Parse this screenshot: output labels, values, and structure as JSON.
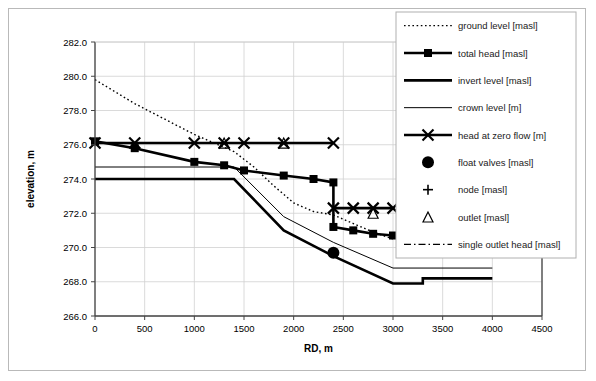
{
  "chart_data": {
    "type": "line",
    "title": "",
    "xlabel": "RD, m",
    "ylabel": "elevation, m",
    "xlim": [
      0,
      4500
    ],
    "ylim": [
      266.0,
      282.0
    ],
    "xticks": [
      0,
      500,
      1000,
      1500,
      2000,
      2500,
      3000,
      3500,
      4000,
      4500
    ],
    "xtick_labels": [
      "0",
      "500",
      "1000",
      "1500",
      "2000",
      "2500",
      "3000",
      "3500",
      "4000",
      "4500"
    ],
    "yticks": [
      266.0,
      268.0,
      270.0,
      272.0,
      274.0,
      276.0,
      278.0,
      280.0,
      282.0
    ],
    "ytick_labels": [
      "266.0",
      "268.0",
      "270.0",
      "272.0",
      "274.0",
      "276.0",
      "278.0",
      "280.0",
      "282.0"
    ],
    "grid": true,
    "legend_position": "upper right",
    "series": [
      {
        "name": "ground level [masl]",
        "style": "dotted",
        "marker": "none",
        "color": "#000000",
        "x": [
          0,
          200,
          400,
          600,
          800,
          1000,
          1200,
          1400,
          1600,
          1800,
          2000,
          2200,
          2400,
          2600,
          2800,
          3000
        ],
        "values": [
          279.8,
          279.1,
          278.4,
          277.8,
          277.2,
          276.6,
          276.1,
          275.6,
          274.7,
          273.6,
          272.6,
          272.1,
          271.9,
          271.4,
          270.9,
          270.5
        ]
      },
      {
        "name": "total head [masl]",
        "style": "thick-solid",
        "marker": "square",
        "color": "#000000",
        "x": [
          0,
          400,
          1000,
          1300,
          1500,
          1900,
          2200,
          2400,
          2400,
          2600,
          2800,
          3000
        ],
        "values": [
          276.2,
          275.8,
          275.0,
          274.8,
          274.5,
          274.2,
          274.0,
          273.8,
          271.2,
          271.0,
          270.8,
          270.7
        ]
      },
      {
        "name": "invert level [masl]",
        "style": "thick-solid",
        "marker": "none",
        "color": "#000000",
        "x": [
          0,
          1400,
          1900,
          2400,
          3000,
          3300,
          3300,
          4000
        ],
        "values": [
          274.0,
          274.0,
          271.0,
          269.5,
          267.9,
          267.9,
          268.2,
          268.2
        ]
      },
      {
        "name": "crown level [m]",
        "style": "thin-solid",
        "marker": "none",
        "color": "#000000",
        "x": [
          0,
          1400,
          1900,
          2400,
          3000,
          4000
        ],
        "values": [
          274.7,
          274.7,
          271.8,
          270.3,
          268.8,
          268.8
        ]
      },
      {
        "name": "head at zero flow [m]",
        "style": "thick-solid",
        "marker": "x",
        "color": "#000000",
        "segments": [
          {
            "x": [
              0,
              400,
              1000,
              1300,
              1500,
              1900,
              2400
            ],
            "values": [
              276.1,
              276.1,
              276.1,
              276.1,
              276.1,
              276.1,
              276.1
            ]
          },
          {
            "x": [
              2400,
              2600,
              2800,
              3000
            ],
            "values": [
              272.3,
              272.3,
              272.3,
              272.3
            ]
          }
        ]
      },
      {
        "name": "float  valves [masl]",
        "style": "none",
        "marker": "circle",
        "color": "#000000",
        "x": [
          2400
        ],
        "values": [
          269.7
        ]
      },
      {
        "name": "node [masl]",
        "style": "none",
        "marker": "plus",
        "color": "#000000",
        "x": [],
        "values": []
      },
      {
        "name": "outlet [masl]",
        "style": "none",
        "marker": "triangle",
        "color": "#000000",
        "x": [
          1300,
          1900,
          2800
        ],
        "values": [
          276.1,
          276.1,
          272.0
        ]
      },
      {
        "name": "single outlet head [masl]",
        "style": "dash-dot",
        "marker": "none",
        "color": "#000000",
        "x": [],
        "values": []
      }
    ]
  },
  "legend": {
    "items": [
      {
        "label": "ground level [masl]",
        "style": "dotted",
        "marker": "none"
      },
      {
        "label": "total head [masl]",
        "style": "thick-solid",
        "marker": "square"
      },
      {
        "label": "invert level [masl]",
        "style": "thick-solid",
        "marker": "none"
      },
      {
        "label": "crown level [m]",
        "style": "thin-solid",
        "marker": "none"
      },
      {
        "label": "head at zero flow [m]",
        "style": "thick-solid",
        "marker": "x"
      },
      {
        "label": "float  valves [masl]",
        "style": "none",
        "marker": "circle"
      },
      {
        "label": "node [masl]",
        "style": "none",
        "marker": "plus"
      },
      {
        "label": "outlet [masl]",
        "style": "none",
        "marker": "triangle"
      },
      {
        "label": "single outlet head [masl]",
        "style": "dash-dot",
        "marker": "none"
      }
    ]
  },
  "colors": {
    "ink": "#000000",
    "grid": "#d0d0d0",
    "axis": "#555555",
    "border": "#b9b9b9",
    "legend_border": "#b0b0b0"
  }
}
